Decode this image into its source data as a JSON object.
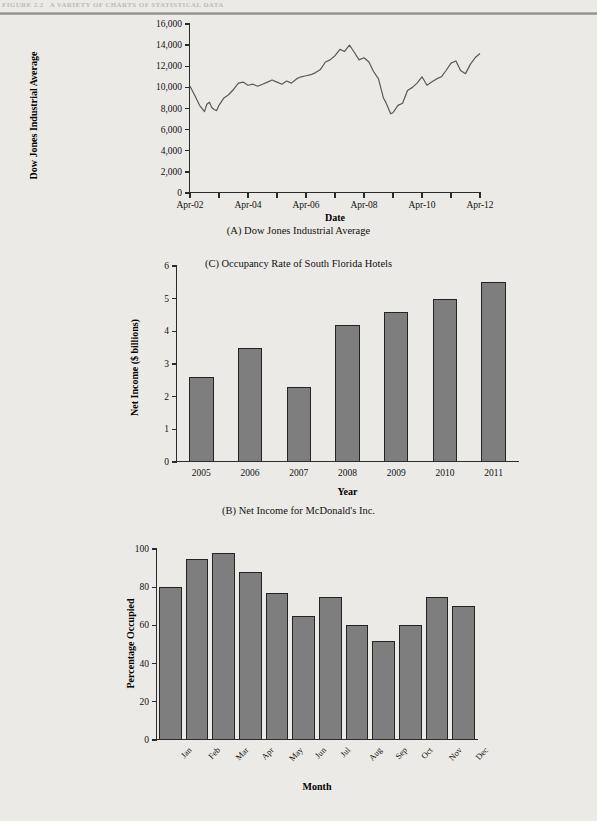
{
  "header": {
    "figure_number": "FIGURE 2.2",
    "figure_title": "A VARIETY OF CHARTS OF STATISTICAL DATA"
  },
  "charts": [
    {
      "id": "dow-jones",
      "caption": "(A) Dow Jones Industrial Average",
      "xlabel": "Date",
      "ylabel": "Dow Jones Industrial Average"
    },
    {
      "id": "mcdonalds-net-income",
      "caption": "(B) Net Income for McDonald's Inc.",
      "xlabel": "Year",
      "ylabel": "Net Income ($ billions)"
    },
    {
      "id": "hotel-occupancy",
      "caption": "(C) Occupancy Rate of South Florida Hotels",
      "xlabel": "Month",
      "ylabel": "Percentage Occupied"
    }
  ],
  "chart_data": [
    {
      "type": "line",
      "title": "(A) Dow Jones Industrial Average",
      "xlabel": "Date",
      "ylabel": "Dow Jones Industrial Average",
      "ylim": [
        0,
        16000
      ],
      "yticks": [
        0,
        2000,
        4000,
        6000,
        8000,
        10000,
        12000,
        14000,
        16000
      ],
      "ytick_labels": [
        "0",
        "2,000",
        "4,000",
        "6,000",
        "8,000",
        "10,000",
        "12,000",
        "14,000",
        "16,000"
      ],
      "xlim": [
        2002.25,
        2012.25
      ],
      "xticks": [
        2002.25,
        2003.25,
        2004.25,
        2005.25,
        2006.25,
        2007.25,
        2008.25,
        2009.25,
        2010.25,
        2011.25,
        2012.25
      ],
      "xtick_labels": [
        "Apr-02",
        "",
        "Apr-04",
        "",
        "Apr-06",
        "",
        "Apr-08",
        "",
        "Apr-10",
        "",
        "Apr-12"
      ],
      "grid": false,
      "legend": "none",
      "line_color": "#595959",
      "x": [
        2002.25,
        2002.42,
        2002.58,
        2002.75,
        2002.83,
        2002.92,
        2003.0,
        2003.08,
        2003.17,
        2003.25,
        2003.42,
        2003.58,
        2003.75,
        2003.92,
        2004.08,
        2004.25,
        2004.42,
        2004.58,
        2004.75,
        2004.92,
        2005.08,
        2005.25,
        2005.42,
        2005.58,
        2005.75,
        2005.92,
        2006.08,
        2006.25,
        2006.42,
        2006.58,
        2006.75,
        2006.92,
        2007.08,
        2007.25,
        2007.42,
        2007.58,
        2007.75,
        2007.92,
        2008.08,
        2008.25,
        2008.42,
        2008.58,
        2008.75,
        2008.92,
        2009.0,
        2009.17,
        2009.25,
        2009.42,
        2009.58,
        2009.75,
        2009.92,
        2010.08,
        2010.25,
        2010.42,
        2010.58,
        2010.75,
        2010.92,
        2011.08,
        2011.25,
        2011.42,
        2011.58,
        2011.75,
        2011.92,
        2012.08,
        2012.25
      ],
      "y": [
        10100,
        9200,
        8300,
        7700,
        8400,
        8600,
        8100,
        7900,
        7800,
        8300,
        9000,
        9300,
        9800,
        10400,
        10500,
        10200,
        10300,
        10100,
        10300,
        10500,
        10700,
        10500,
        10300,
        10600,
        10400,
        10800,
        11000,
        11100,
        11200,
        11400,
        11700,
        12400,
        12600,
        13000,
        13600,
        13400,
        14000,
        13300,
        12600,
        12800,
        12400,
        11500,
        10800,
        9000,
        8600,
        7500,
        7600,
        8300,
        8500,
        9700,
        10000,
        10400,
        11000,
        10200,
        10500,
        10800,
        11000,
        11600,
        12300,
        12500,
        11600,
        11300,
        12200,
        12800,
        13200
      ],
      "notes": "Monthly closing level of the Dow Jones Industrial Average, April 2002 through April 2012."
    },
    {
      "type": "bar",
      "title": "(B) Net Income for McDonald's Inc.",
      "xlabel": "Year",
      "ylabel": "Net Income ($ billions)",
      "categories": [
        "2005",
        "2006",
        "2007",
        "2008",
        "2009",
        "2010",
        "2011"
      ],
      "values": [
        2.6,
        3.5,
        2.3,
        4.2,
        4.6,
        5.0,
        5.5
      ],
      "ylim": [
        0,
        6
      ],
      "yticks": [
        0,
        1,
        2,
        3,
        4,
        5,
        6
      ],
      "ytick_labels": [
        "0",
        "1",
        "2",
        "3",
        "4",
        "5",
        "6"
      ],
      "grid": false,
      "legend": "none",
      "bar_color": "#7e7e7e",
      "bar_edge_color": "#242424"
    },
    {
      "type": "bar",
      "title": "(C) Occupancy Rate of South Florida Hotels",
      "xlabel": "Month",
      "ylabel": "Percentage Occupied",
      "categories": [
        "Jan",
        "Feb",
        "Mar",
        "Apr",
        "May",
        "Jun",
        "Jul",
        "Aug",
        "Sep",
        "Oct",
        "Nov",
        "Dec"
      ],
      "values": [
        80,
        95,
        98,
        88,
        77,
        65,
        75,
        60,
        52,
        60,
        75,
        70
      ],
      "ylim": [
        0,
        100
      ],
      "yticks": [
        0,
        20,
        40,
        60,
        80,
        100
      ],
      "ytick_labels": [
        "0",
        "20",
        "40",
        "60",
        "80",
        "100"
      ],
      "grid": false,
      "legend": "none",
      "bar_color": "#7e7e7e",
      "bar_edge_color": "#242424"
    }
  ]
}
